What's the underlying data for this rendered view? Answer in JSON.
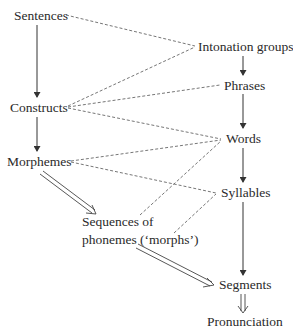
{
  "diagram": {
    "type": "linguistic-levels-mapping",
    "colors": {
      "text": "#2a2a2a",
      "line": "#444444",
      "dashed": "#666666",
      "background": "#ffffff"
    },
    "nodes": {
      "sentences": "Sentences",
      "constructs": "Constructs",
      "morphemes": "Morphemes",
      "sequences_line1": "Sequences of",
      "sequences_line2": "phonemes (‘morphs’)",
      "intonation_groups": "Intonation groups",
      "phrases": "Phrases",
      "words": "Words",
      "syllables": "Syllables",
      "segments": "Segments",
      "pronunciation": "Pronunciation"
    },
    "edges": [
      {
        "from": "Sentences",
        "to": "Constructs",
        "style": "solid-arrow"
      },
      {
        "from": "Constructs",
        "to": "Morphemes",
        "style": "solid-arrow"
      },
      {
        "from": "Morphemes",
        "to": "Sequences of phonemes ('morphs')",
        "style": "double-arrow"
      },
      {
        "from": "Sequences of phonemes ('morphs')",
        "to": "Segments",
        "style": "double-arrow"
      },
      {
        "from": "Intonation groups",
        "to": "Phrases",
        "style": "solid-arrow"
      },
      {
        "from": "Phrases",
        "to": "Words",
        "style": "solid-arrow"
      },
      {
        "from": "Words",
        "to": "Syllables",
        "style": "solid-arrow"
      },
      {
        "from": "Syllables",
        "to": "Segments",
        "style": "solid-arrow"
      },
      {
        "from": "Segments",
        "to": "Pronunciation",
        "style": "double-arrow"
      },
      {
        "from": "Sentences",
        "to": "Intonation groups",
        "style": "dashed"
      },
      {
        "from": "Constructs",
        "to": "Intonation groups",
        "style": "dashed"
      },
      {
        "from": "Constructs",
        "to": "Phrases",
        "style": "dashed"
      },
      {
        "from": "Constructs",
        "to": "Words",
        "style": "dashed"
      },
      {
        "from": "Morphemes",
        "to": "Words",
        "style": "dashed"
      },
      {
        "from": "Morphemes",
        "to": "Syllables",
        "style": "dashed"
      },
      {
        "from": "Sequences of phonemes ('morphs')",
        "to": "Words",
        "style": "dashed"
      },
      {
        "from": "Sequences of phonemes ('morphs')",
        "to": "Syllables",
        "style": "dashed"
      }
    ]
  }
}
